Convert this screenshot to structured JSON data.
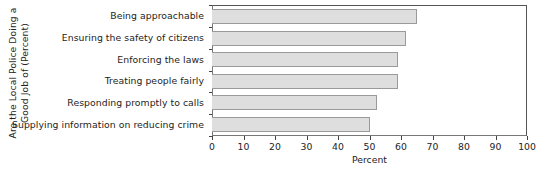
{
  "chart_data": {
    "type": "bar",
    "orientation": "horizontal",
    "title": "",
    "xlabel": "Percent",
    "ylabel": "Are the Local Police Doing a Good Job of (Percent)",
    "ylabel_lines": [
      "Are the Local Police Doing a",
      "Good Job of (Percent)"
    ],
    "categories": [
      "Being approachable",
      "Ensuring the safety of citizens",
      "Enforcing the laws",
      "Treating people fairly",
      "Responding promptly to calls",
      "Supplying information on reducing crime"
    ],
    "values": [
      65,
      61.5,
      59,
      59,
      52.5,
      50
    ],
    "xlim": [
      0,
      100
    ],
    "xticks": [
      0,
      10,
      20,
      30,
      40,
      50,
      60,
      70,
      80,
      90,
      100
    ],
    "xtick_labels": [
      "0",
      "10",
      "20",
      "30",
      "40",
      "50",
      "60",
      "70",
      "80",
      "90",
      "100"
    ],
    "grid": false,
    "legend": false,
    "bar_fill_color": "#dedede",
    "bar_border_color": "#9a9a9a",
    "axis_color": "#444444",
    "text_color": "#232323"
  }
}
